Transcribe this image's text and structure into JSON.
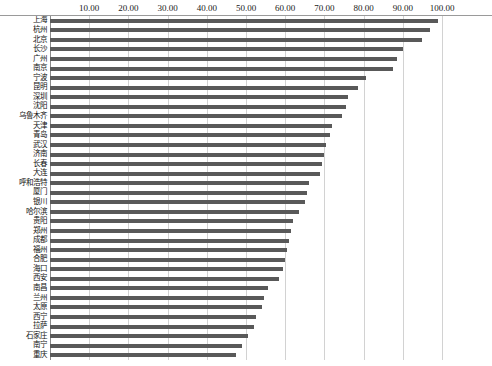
{
  "chart_data": {
    "type": "bar",
    "orientation": "horizontal",
    "title": "",
    "xlabel": "",
    "ylabel": "",
    "xlim": [
      0,
      100
    ],
    "grid": true,
    "legend": null,
    "bar_color": "#595959",
    "tick_labels": [
      "10.00",
      "20.00",
      "30.00",
      "40.00",
      "50.00",
      "60.00",
      "70.00",
      "80.00",
      "90.00",
      "100.00"
    ],
    "ticks": [
      10,
      20,
      30,
      40,
      50,
      60,
      70,
      80,
      90,
      100
    ],
    "categories": [
      "上海",
      "杭州",
      "北京",
      "长沙",
      "广州",
      "南京",
      "宁波",
      "昆明",
      "深圳",
      "沈阳",
      "乌鲁木齐",
      "天津",
      "青岛",
      "武汉",
      "济南",
      "长春",
      "大连",
      "呼和浩特",
      "厦门",
      "银川",
      "哈尔滨",
      "贵阳",
      "郑州",
      "成都",
      "福州",
      "合肥",
      "海口",
      "西安",
      "南昌",
      "兰州",
      "太原",
      "西宁",
      "拉萨",
      "石家庄",
      "南宁",
      "重庆"
    ],
    "values": [
      99.0,
      97.0,
      95.0,
      90.0,
      88.5,
      87.5,
      80.5,
      78.5,
      76.0,
      75.5,
      74.5,
      72.0,
      71.5,
      70.5,
      70.0,
      69.5,
      69.0,
      66.0,
      65.5,
      65.0,
      63.5,
      62.0,
      61.5,
      61.0,
      60.5,
      60.0,
      59.5,
      58.5,
      55.5,
      54.5,
      54.0,
      52.5,
      52.0,
      50.5,
      49.0,
      47.5
    ]
  }
}
